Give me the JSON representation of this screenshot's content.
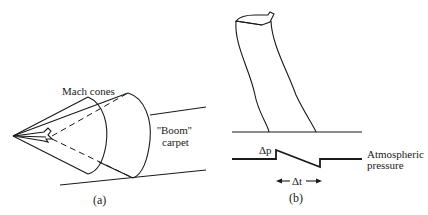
{
  "panel_a": {
    "label": "(a)",
    "mach_cones_label": "Mach cones",
    "boom_label": "““Boom””",
    "boom_label_text": "''Boom''",
    "carpet_label": "carpet"
  },
  "panel_b": {
    "label": "(b)",
    "delta_p_label": "Δp",
    "delta_t_label": "Δt",
    "atmospheric_label": "Atmospheric",
    "pressure_label": "pressure"
  },
  "colors": {
    "ink": "#1a1a1a",
    "background": "#ffffff"
  }
}
